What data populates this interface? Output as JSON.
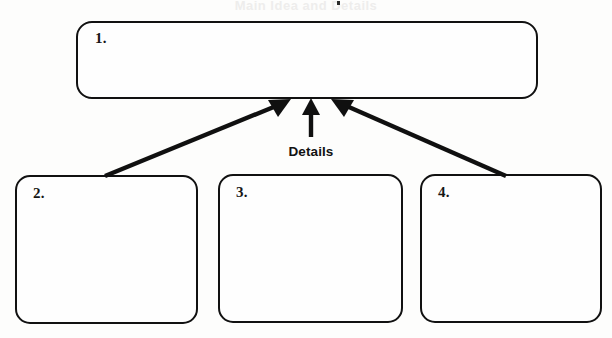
{
  "diagram": {
    "type": "hierarchy-organizer",
    "title_artifact": "Main Idea and Details",
    "connector_label": "Details",
    "background_color": "#fdfdfc",
    "stroke_color": "#111111",
    "boxes": [
      {
        "id": "box-main",
        "label": "1.",
        "role": "main-idea",
        "value": "",
        "placeholder": ""
      },
      {
        "id": "box-detail-2",
        "label": "2.",
        "role": "detail",
        "value": "",
        "placeholder": ""
      },
      {
        "id": "box-detail-3",
        "label": "3.",
        "role": "detail",
        "value": "",
        "placeholder": ""
      },
      {
        "id": "box-detail-4",
        "label": "4.",
        "role": "detail",
        "value": "",
        "placeholder": ""
      }
    ],
    "arrows": [
      {
        "id": "arrow-left",
        "from": "box-detail-2",
        "to": "box-main",
        "direction": "up-right"
      },
      {
        "id": "arrow-middle",
        "from": "box-detail-3",
        "to": "box-main",
        "direction": "up"
      },
      {
        "id": "arrow-right",
        "from": "box-detail-4",
        "to": "box-main",
        "direction": "up-left"
      }
    ]
  }
}
